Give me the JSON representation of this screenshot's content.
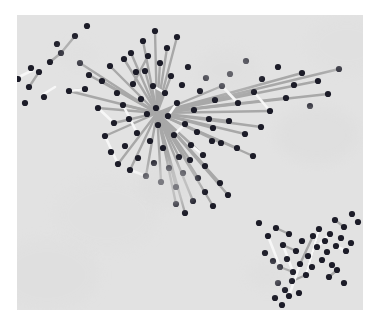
{
  "figure": {
    "width": 380,
    "height": 325,
    "background_color": "#ffffff",
    "panel": {
      "x": 17,
      "y": 15,
      "width": 346,
      "height": 295,
      "color": "#e2e2e2"
    }
  },
  "style": {
    "point_color": "#1c1c28",
    "point_radius": 3.1,
    "ray_color": "#a8a8a8",
    "ray_width": 2.4,
    "highlight_color": "#f7f7f7",
    "highlight_width": 2.6,
    "panel_color": "#e2e2e2"
  },
  "chart_data": {
    "type": "scatter",
    "title": "",
    "subtitle": "",
    "xlabel": "",
    "ylabel": "",
    "xlim": [
      0,
      346
    ],
    "ylim": [
      0,
      295
    ],
    "grid": false,
    "legend": null,
    "axis_ticks": [],
    "tick_labels": [],
    "annotations": [],
    "hub": {
      "x": 140,
      "y": 98
    },
    "series": [
      {
        "name": "points",
        "color": "#1c1c28",
        "points": [
          [
            1,
            64
          ],
          [
            14,
            53
          ],
          [
            40,
            29
          ],
          [
            52,
            76
          ],
          [
            63,
            48
          ],
          [
            68,
            74
          ],
          [
            72,
            60
          ],
          [
            81,
            93
          ],
          [
            85,
            66
          ],
          [
            93,
            51
          ],
          [
            97,
            108
          ],
          [
            100,
            78
          ],
          [
            106,
            90
          ],
          [
            112,
            104
          ],
          [
            116,
            69
          ],
          [
            120,
            118
          ],
          [
            124,
            84
          ],
          [
            128,
            56
          ],
          [
            130,
            99
          ],
          [
            133,
            126
          ],
          [
            136,
            71
          ],
          [
            139,
            93
          ],
          [
            141,
            110
          ],
          [
            143,
            48
          ],
          [
            146,
            133
          ],
          [
            148,
            78
          ],
          [
            151,
            101
          ],
          [
            154,
            61
          ],
          [
            157,
            120
          ],
          [
            160,
            88
          ],
          [
            162,
            142
          ],
          [
            165,
            70
          ],
          [
            168,
            109
          ],
          [
            171,
            52
          ],
          [
            174,
            130
          ],
          [
            177,
            95
          ],
          [
            180,
            117
          ],
          [
            183,
            76
          ],
          [
            186,
            140
          ],
          [
            189,
            63
          ],
          [
            192,
            104
          ],
          [
            195,
            126
          ],
          [
            198,
            85
          ],
          [
            114,
            38
          ],
          [
            126,
            26
          ],
          [
            138,
            16
          ],
          [
            150,
            33
          ],
          [
            160,
            22
          ],
          [
            107,
            44
          ],
          [
            119,
            57
          ],
          [
            131,
            41
          ],
          [
            88,
            121
          ],
          [
            94,
            137
          ],
          [
            101,
            149
          ],
          [
            108,
            131
          ],
          [
            113,
            155
          ],
          [
            121,
            143
          ],
          [
            129,
            161
          ],
          [
            137,
            148
          ],
          [
            144,
            167
          ],
          [
            152,
            153
          ],
          [
            159,
            172
          ],
          [
            166,
            158
          ],
          [
            173,
            145
          ],
          [
            181,
            163
          ],
          [
            188,
            151
          ],
          [
            205,
            71
          ],
          [
            213,
            59
          ],
          [
            221,
            88
          ],
          [
            229,
            46
          ],
          [
            237,
            77
          ],
          [
            245,
            64
          ],
          [
            253,
            96
          ],
          [
            261,
            52
          ],
          [
            269,
            83
          ],
          [
            277,
            70
          ],
          [
            285,
            58
          ],
          [
            293,
            91
          ],
          [
            301,
            66
          ],
          [
            311,
            79
          ],
          [
            322,
            54
          ],
          [
            196,
            113
          ],
          [
            204,
            128
          ],
          [
            212,
            106
          ],
          [
            220,
            133
          ],
          [
            228,
            119
          ],
          [
            236,
            141
          ],
          [
            244,
            112
          ],
          [
            58,
            21
          ],
          [
            70,
            11
          ],
          [
            44,
            38
          ],
          [
            33,
            47
          ],
          [
            22,
            57
          ],
          [
            12,
            72
          ],
          [
            27,
            82
          ],
          [
            8,
            88
          ],
          [
            242,
            208
          ],
          [
            251,
            221
          ],
          [
            259,
            213
          ],
          [
            266,
            230
          ],
          [
            272,
            219
          ],
          [
            279,
            236
          ],
          [
            285,
            226
          ],
          [
            291,
            241
          ],
          [
            248,
            238
          ],
          [
            256,
            246
          ],
          [
            263,
            252
          ],
          [
            270,
            244
          ],
          [
            276,
            257
          ],
          [
            283,
            249
          ],
          [
            289,
            260
          ],
          [
            295,
            252
          ],
          [
            300,
            232
          ],
          [
            305,
            245
          ],
          [
            310,
            237
          ],
          [
            315,
            250
          ],
          [
            296,
            221
          ],
          [
            302,
            214
          ],
          [
            308,
            226
          ],
          [
            313,
            219
          ],
          [
            319,
            231
          ],
          [
            324,
            223
          ],
          [
            329,
            236
          ],
          [
            334,
            228
          ],
          [
            261,
            268
          ],
          [
            268,
            275
          ],
          [
            275,
            266
          ],
          [
            282,
            278
          ],
          [
            258,
            283
          ],
          [
            265,
            290
          ],
          [
            272,
            281
          ],
          [
            318,
            205
          ],
          [
            327,
            212
          ],
          [
            335,
            199
          ],
          [
            341,
            207
          ],
          [
            312,
            262
          ],
          [
            320,
            255
          ],
          [
            327,
            268
          ],
          [
            203,
            168
          ],
          [
            211,
            180
          ],
          [
            196,
            191
          ],
          [
            188,
            177
          ],
          [
            176,
            186
          ],
          [
            168,
            198
          ],
          [
            159,
            189
          ]
        ]
      }
    ],
    "rays": {
      "name": "displacement-segments",
      "color": "#a8a8a8",
      "description": "Line segments from the central hub outward to point locations",
      "segments": [
        [
          140,
          98,
          143,
          48
        ],
        [
          140,
          98,
          154,
          61
        ],
        [
          140,
          98,
          128,
          56
        ],
        [
          140,
          98,
          160,
          22
        ],
        [
          140,
          98,
          150,
          33
        ],
        [
          140,
          98,
          138,
          16
        ],
        [
          140,
          98,
          126,
          26
        ],
        [
          140,
          98,
          114,
          38
        ],
        [
          140,
          98,
          107,
          44
        ],
        [
          140,
          98,
          93,
          51
        ],
        [
          140,
          98,
          63,
          48
        ],
        [
          140,
          98,
          85,
          66
        ],
        [
          140,
          98,
          72,
          60
        ],
        [
          140,
          98,
          52,
          76
        ],
        [
          140,
          98,
          81,
          93
        ],
        [
          140,
          98,
          97,
          108
        ],
        [
          140,
          98,
          106,
          90
        ],
        [
          140,
          98,
          88,
          121
        ],
        [
          140,
          98,
          101,
          149
        ],
        [
          140,
          98,
          113,
          155
        ],
        [
          140,
          98,
          129,
          161
        ],
        [
          140,
          98,
          144,
          167
        ],
        [
          140,
          98,
          162,
          142
        ],
        [
          140,
          98,
          186,
          140
        ],
        [
          140,
          98,
          159,
          172
        ],
        [
          140,
          98,
          173,
          145
        ],
        [
          140,
          98,
          181,
          163
        ],
        [
          140,
          98,
          188,
          151
        ],
        [
          140,
          98,
          205,
          71
        ],
        [
          140,
          98,
          221,
          88
        ],
        [
          140,
          98,
          237,
          77
        ],
        [
          140,
          98,
          253,
          96
        ],
        [
          140,
          98,
          269,
          83
        ],
        [
          140,
          98,
          285,
          58
        ],
        [
          140,
          98,
          301,
          66
        ],
        [
          140,
          98,
          311,
          79
        ],
        [
          140,
          98,
          322,
          54
        ],
        [
          140,
          98,
          196,
          113
        ],
        [
          140,
          98,
          212,
          106
        ],
        [
          140,
          98,
          228,
          119
        ],
        [
          140,
          98,
          244,
          112
        ],
        [
          140,
          98,
          236,
          141
        ],
        [
          140,
          98,
          220,
          133
        ],
        [
          140,
          98,
          204,
          128
        ],
        [
          140,
          98,
          203,
          168
        ],
        [
          140,
          98,
          211,
          180
        ],
        [
          140,
          98,
          196,
          191
        ],
        [
          140,
          98,
          176,
          186
        ],
        [
          140,
          98,
          168,
          198
        ],
        [
          140,
          98,
          159,
          189
        ],
        [
          44,
          38,
          58,
          21
        ],
        [
          33,
          47,
          44,
          38
        ],
        [
          22,
          57,
          12,
          72
        ],
        [
          68,
          74,
          52,
          76
        ],
        [
          116,
          69,
          131,
          41
        ],
        [
          259,
          213,
          272,
          219
        ],
        [
          266,
          230,
          279,
          236
        ],
        [
          283,
          249,
          296,
          221
        ],
        [
          289,
          260,
          302,
          214
        ],
        [
          275,
          266,
          289,
          260
        ],
        [
          263,
          252,
          276,
          257
        ],
        [
          318,
          205,
          327,
          212
        ],
        [
          312,
          262,
          320,
          255
        ]
      ]
    },
    "highlights": {
      "name": "highlight-streaks",
      "color": "#f7f7f7",
      "description": "Short white streaks overlaying a subset of points",
      "segments": [
        [
          52,
          76,
          68,
          74
        ],
        [
          81,
          93,
          97,
          108
        ],
        [
          106,
          90,
          120,
          118
        ],
        [
          88,
          121,
          101,
          149
        ],
        [
          113,
          155,
          129,
          161
        ],
        [
          2,
          62,
          16,
          55
        ],
        [
          25,
          80,
          38,
          72
        ],
        [
          136,
          71,
          148,
          78
        ],
        [
          151,
          101,
          160,
          88
        ],
        [
          174,
          130,
          186,
          140
        ],
        [
          157,
          120,
          168,
          109
        ],
        [
          251,
          221,
          263,
          252
        ],
        [
          266,
          230,
          276,
          257
        ],
        [
          289,
          260,
          302,
          214
        ],
        [
          300,
          232,
          313,
          219
        ],
        [
          272,
          281,
          283,
          249
        ],
        [
          319,
          231,
          329,
          236
        ],
        [
          205,
          71,
          221,
          88
        ],
        [
          237,
          77,
          253,
          96
        ]
      ]
    }
  }
}
